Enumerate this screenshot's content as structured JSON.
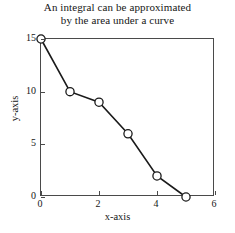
{
  "chart_data": {
    "type": "line",
    "title": "An integral can be approximated by the area under a curve",
    "title_lines": [
      "An integral can be approximated",
      "by the area under a curve"
    ],
    "xlabel": "x-axis",
    "ylabel": "y-axis",
    "x": [
      0,
      1,
      2,
      3,
      4,
      5
    ],
    "values": [
      15,
      10,
      9,
      6,
      2,
      0
    ],
    "series": [
      {
        "name": "curve",
        "x": [
          0,
          1,
          2,
          3,
          4,
          5
        ],
        "values": [
          15,
          10,
          9,
          6,
          2,
          0
        ]
      }
    ],
    "xlim": [
      0,
      6
    ],
    "ylim": [
      0,
      15
    ],
    "xticks": [
      0,
      2,
      4,
      6
    ],
    "yticks": [
      0,
      5,
      10,
      15
    ],
    "xticklabels": [
      "0",
      "2",
      "4",
      "6"
    ],
    "yticklabels": [
      "0",
      "5",
      "10",
      "15"
    ],
    "grid": false,
    "legend": null,
    "marker": "open-circle",
    "line_color": "#1a1a1a",
    "marker_color": "#1a1a1a",
    "background_color": "#ffffff",
    "axis_color": "#4a4a4a"
  }
}
